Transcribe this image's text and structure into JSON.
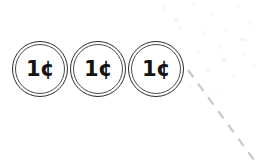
{
  "document": {
    "title": "Penny Coin Icons",
    "background_color": "#ffffff",
    "width": 259,
    "height": 165
  },
  "coin_row": {
    "count": 3,
    "coins": [
      {
        "id": "coin-1",
        "denomination": "1¢",
        "name": "penny",
        "center_x": 40,
        "center_y": 69,
        "diameter": 56,
        "outline_color": "#2b2b2b",
        "fill_color": "#ffffff",
        "text_color": "#141414"
      },
      {
        "id": "coin-2",
        "denomination": "1¢",
        "name": "penny",
        "center_x": 98,
        "center_y": 69,
        "diameter": 56,
        "outline_color": "#2b2b2b",
        "fill_color": "#ffffff",
        "text_color": "#141414"
      },
      {
        "id": "coin-3",
        "denomination": "1¢",
        "name": "penny",
        "center_x": 156,
        "center_y": 69,
        "diameter": 56,
        "outline_color": "#2b2b2b",
        "fill_color": "#ffffff",
        "text_color": "#141414"
      }
    ]
  },
  "guide_line": {
    "style": "dashed",
    "color": "#c9c9c9",
    "orientation": "diagonal-down-right",
    "start_x": 188,
    "start_y": 70,
    "end_x": 254,
    "end_y": 160,
    "stroke_width": 2.2,
    "dash_pattern": "9 8"
  },
  "scan_noise": {
    "color": "#f2f2f2",
    "description": "faint scan speckle"
  }
}
